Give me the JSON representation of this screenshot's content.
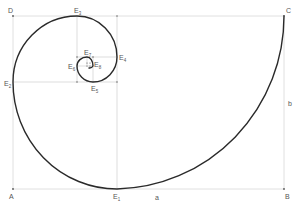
{
  "diagram": {
    "type": "golden-spiral",
    "rectangle": {
      "corners": [
        {
          "id": "A",
          "label": "A",
          "x": 13,
          "y": 189
        },
        {
          "id": "B",
          "label": "B",
          "x": 284,
          "y": 189
        },
        {
          "id": "C",
          "label": "C",
          "x": 284,
          "y": 16
        },
        {
          "id": "D",
          "label": "D",
          "x": 13,
          "y": 16
        }
      ],
      "side_labels": {
        "a": "a",
        "b": "b"
      }
    },
    "points": [
      {
        "id": "E1",
        "base": "E",
        "sub": "1",
        "x": 117,
        "y": 189
      },
      {
        "id": "E2",
        "base": "E",
        "sub": "2",
        "x": 13,
        "y": 82
      },
      {
        "id": "E3",
        "base": "E",
        "sub": "3",
        "x": 77,
        "y": 16
      },
      {
        "id": "E4",
        "base": "E",
        "sub": "4",
        "x": 117,
        "y": 57
      },
      {
        "id": "E5",
        "base": "E",
        "sub": "5",
        "x": 93,
        "y": 82
      },
      {
        "id": "E6",
        "base": "E",
        "sub": "6",
        "x": 77,
        "y": 66
      },
      {
        "id": "E7",
        "base": "E",
        "sub": "7",
        "x": 87,
        "y": 57
      },
      {
        "id": "E8",
        "base": "E",
        "sub": "8",
        "x": 93,
        "y": 66
      }
    ],
    "colors": {
      "curve": "#2a2a2a",
      "guides": "#d4d4d4",
      "labels": "#555555"
    }
  }
}
